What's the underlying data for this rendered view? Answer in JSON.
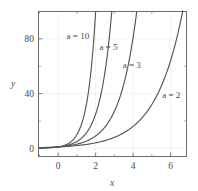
{
  "chart_data": {
    "type": "line",
    "title": "",
    "xlabel": "x",
    "ylabel": "y",
    "xlim": [
      -1.05,
      6.85
    ],
    "ylim": [
      -6,
      100
    ],
    "xticks": [
      0,
      2,
      4,
      6
    ],
    "xticklabels": [
      "0",
      "2",
      "4",
      "6"
    ],
    "xminorticks": [
      -1,
      1,
      3,
      5
    ],
    "yticks": [
      0,
      40,
      80
    ],
    "yticklabels": [
      "0",
      "40",
      "80"
    ],
    "yminorticks": [
      20,
      60,
      100
    ],
    "grid": true,
    "legend": "inline-annotations",
    "legend_position": "inline",
    "function": "y = a^x",
    "series": [
      {
        "name": "a = 2",
        "label": "a = 2",
        "base": 2,
        "label_x": 5.55,
        "label_y": 37,
        "x": [
          -1,
          -0.5,
          0,
          0.5,
          1,
          1.5,
          2,
          2.5,
          3,
          3.5,
          4,
          4.5,
          5,
          5.5,
          6,
          6.5,
          6.65
        ],
        "y": [
          0.5,
          0.71,
          1,
          1.41,
          2,
          2.83,
          4,
          5.66,
          8,
          11.31,
          16,
          22.63,
          32,
          45.25,
          64,
          90.51,
          100.4
        ]
      },
      {
        "name": "a = 3",
        "label": "a = 3",
        "base": 3,
        "label_x": 3.45,
        "label_y": 59,
        "x": [
          -1,
          -0.5,
          0,
          0.5,
          1,
          1.5,
          2,
          2.5,
          3,
          3.5,
          4,
          4.19
        ],
        "y": [
          0.33,
          0.58,
          1,
          1.73,
          3,
          5.2,
          9,
          15.59,
          27,
          46.77,
          81,
          100.2
        ]
      },
      {
        "name": "a = 5",
        "label": "a = 5",
        "base": 5,
        "label_x": 2.2,
        "label_y": 72,
        "x": [
          -1,
          -0.5,
          0,
          0.5,
          1,
          1.5,
          2,
          2.5,
          2.86
        ],
        "y": [
          0.2,
          0.45,
          1,
          2.24,
          5,
          11.18,
          25,
          55.9,
          100.3
        ]
      },
      {
        "name": "a = 10",
        "label": "a = 10",
        "base": 10,
        "label_x": 0.45,
        "label_y": 80,
        "x": [
          -1,
          -0.5,
          0,
          0.5,
          1,
          1.5,
          2.0
        ],
        "y": [
          0.1,
          0.32,
          1,
          3.16,
          10,
          31.62,
          100
        ]
      }
    ]
  },
  "colors": {
    "curve": "#555555",
    "frame": "#6b6b6b",
    "grid": "#cfcfcf",
    "text": "#4a4a4a",
    "background": "#ffffff"
  }
}
